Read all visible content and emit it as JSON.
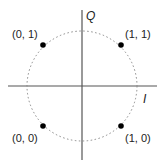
{
  "diagram": {
    "type": "constellation",
    "axes": {
      "horizontal_label": "I",
      "vertical_label": "Q"
    },
    "points": [
      {
        "label": "(0, 1)",
        "quadrant": "top-left"
      },
      {
        "label": "(1, 1)",
        "quadrant": "top-right"
      },
      {
        "label": "(0, 0)",
        "quadrant": "bottom-left"
      },
      {
        "label": "(1, 0)",
        "quadrant": "bottom-right"
      }
    ],
    "colors": {
      "axis": "#555555",
      "circle": "#888888",
      "point": "#000000",
      "text": "#222222"
    }
  }
}
